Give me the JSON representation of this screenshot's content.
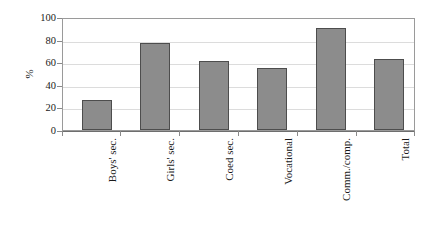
{
  "chart_data": {
    "type": "bar",
    "title": "",
    "subtitle": "",
    "xlabel": "",
    "ylabel": "%",
    "categories": [
      "Boys' sec.",
      "Girls' sec.",
      "Coed sec.",
      "Vocational",
      "Comm./comp.",
      "Total"
    ],
    "values": [
      27,
      77,
      61,
      55,
      90,
      62.5
    ],
    "ylim": [
      0,
      100
    ],
    "yticks": [
      0,
      20,
      40,
      60,
      80,
      100
    ],
    "ytick_labels": [
      "0",
      "20",
      "40",
      "60",
      "80",
      "100"
    ],
    "grid": "horizontal",
    "legend": "none",
    "series": [
      {
        "name": "",
        "values": [
          27,
          77,
          61,
          55,
          90,
          62.5
        ]
      }
    ],
    "colors": {
      "bar_fill": "#8c8c8c",
      "bar_edge": "#4d4d4d",
      "gridline": "#dcdcdc",
      "axis": "#8a8a8a",
      "plot_border": "#9a9a9a",
      "background": "#ffffff",
      "text": "#1a1a1a"
    }
  }
}
